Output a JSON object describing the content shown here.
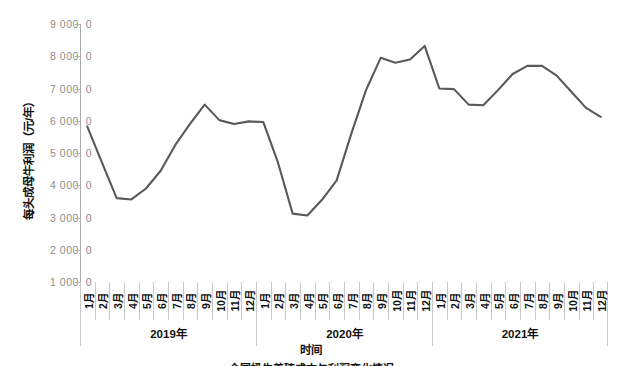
{
  "chart_data": {
    "type": "line",
    "title": "",
    "xlabel": "时间",
    "ylabel": "每头成母牛利润（元/年）",
    "ylim": [
      1000,
      9000
    ],
    "ytick_labels": [
      "9 000. 0",
      "8 000. 0",
      "7 000. 0",
      "6 000. 0",
      "5 000. 0",
      "4 000. 0",
      "3 000. 0",
      "2 000. 0",
      "1 000. 0"
    ],
    "ytick_values": [
      9000,
      8000,
      7000,
      6000,
      5000,
      4000,
      3000,
      2000,
      1000
    ],
    "grid": false,
    "legend": "none",
    "line_color": "#595959",
    "categories": [
      "1月",
      "2月",
      "3月",
      "4月",
      "5月",
      "6月",
      "7月",
      "8月",
      "9月",
      "10月",
      "11月",
      "12月",
      "1月",
      "2月",
      "3月",
      "4月",
      "5月",
      "6月",
      "7月",
      "8月",
      "9月",
      "10月",
      "11月",
      "12月",
      "1月",
      "2月",
      "3月",
      "4月",
      "5月",
      "6月",
      "7月",
      "8月",
      "9月",
      "10月",
      "11月",
      "12月"
    ],
    "groups": [
      {
        "label": "2019年",
        "count": 12
      },
      {
        "label": "2020年",
        "count": 12
      },
      {
        "label": "2021年",
        "count": 12
      }
    ],
    "series": [
      {
        "name": "每头成母牛利润",
        "values": [
          5820,
          4700,
          3600,
          3560,
          3900,
          4450,
          5250,
          5900,
          6500,
          6020,
          5900,
          5980,
          5960,
          4700,
          3120,
          3060,
          3550,
          4150,
          5600,
          6950,
          7950,
          7800,
          7900,
          8320,
          7000,
          6980,
          6500,
          6480,
          6950,
          7450,
          7700,
          7700,
          7400,
          6900,
          6400,
          6120
        ]
      }
    ]
  },
  "caption": "全国奶牛养殖成本与利润变化情况"
}
